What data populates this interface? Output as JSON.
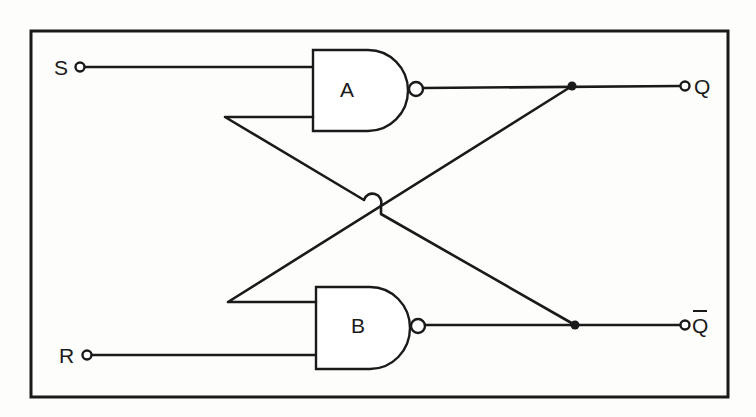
{
  "diagram": {
    "colors": {
      "ink": "#1a1a1a",
      "paper": "#fdfdfb"
    },
    "inputs": [
      {
        "id": "S",
        "label": "S"
      },
      {
        "id": "R",
        "label": "R"
      }
    ],
    "outputs": [
      {
        "id": "Q",
        "label": "Q"
      },
      {
        "id": "Qbar",
        "label": "Q",
        "overbar": true
      }
    ],
    "gates": [
      {
        "id": "A",
        "label": "A",
        "type": "NAND"
      },
      {
        "id": "B",
        "label": "B",
        "type": "NAND"
      }
    ],
    "connections": [
      {
        "from": "S",
        "to": "A.input1"
      },
      {
        "from": "R",
        "to": "B.input2"
      },
      {
        "from": "A.output",
        "to": "Q"
      },
      {
        "from": "B.output",
        "to": "Qbar"
      },
      {
        "from": "Q",
        "to": "B.input1",
        "note": "cross-coupled feedback"
      },
      {
        "from": "Qbar",
        "to": "A.input2",
        "note": "cross-coupled feedback, crossing hop"
      }
    ]
  }
}
